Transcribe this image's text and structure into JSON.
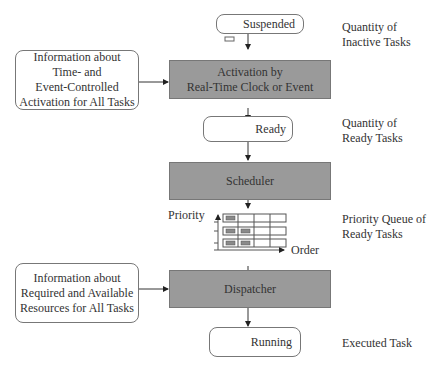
{
  "nodes": {
    "suspended": "Suspended",
    "activation": [
      "Activation by",
      "Real-Time Clock or Event"
    ],
    "ready": "Ready",
    "scheduler": "Scheduler",
    "dispatcher": "Dispatcher",
    "running": "Running"
  },
  "inputs": {
    "time_info": [
      "Information about",
      "Time- and",
      "Event-Controlled",
      "Activation for All Tasks"
    ],
    "resource_info": [
      "Information about",
      "Required and Available",
      "Resources for All Tasks"
    ]
  },
  "side_labels": {
    "inactive": [
      "Quantity of",
      "Inactive Tasks"
    ],
    "ready": [
      "Quantity of",
      "Ready Tasks"
    ],
    "queue": [
      "Priority Queue of",
      "Ready Tasks"
    ],
    "executed": "Executed Task"
  },
  "queue_chart": {
    "y_axis": "Priority",
    "x_axis": "Order"
  }
}
